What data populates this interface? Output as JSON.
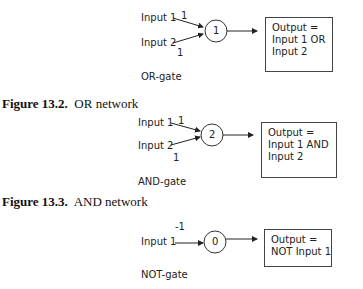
{
  "figures": [
    {
      "id": "or",
      "input1_label": "Input 1",
      "input2_label": "Input 2",
      "weight1": "1",
      "weight2": "1",
      "threshold": "1",
      "gate_label": "OR-gate",
      "output_lines": [
        "Output =",
        "Input 1 OR",
        "Input 2"
      ],
      "caption_num": "Figure 13.2.",
      "caption_text": "OR network"
    },
    {
      "id": "and",
      "input1_label": "Input 1",
      "input2_label": "Input 2",
      "weight1": "1",
      "weight2": "1",
      "threshold": "2",
      "gate_label": "AND-gate",
      "output_lines": [
        "Output =",
        "Input 1 AND",
        "Input 2"
      ],
      "caption_num": "Figure 13.3.",
      "caption_text": "AND network"
    },
    {
      "id": "not",
      "input1_label": "Input 1",
      "weight1": "-1",
      "threshold": "0",
      "gate_label": "NOT-gate",
      "output_lines": [
        "Output =",
        "NOT Input 1"
      ]
    }
  ]
}
